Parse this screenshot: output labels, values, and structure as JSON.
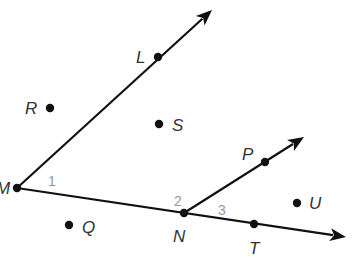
{
  "diagram": {
    "type": "geometry-rays-and-angles",
    "colors": {
      "stroke": "#111111",
      "point_label": "#333333",
      "angle_label": "#999999"
    },
    "points": [
      {
        "name": "M",
        "label": "M",
        "x": 17,
        "y": 188,
        "lx": -4,
        "ly": 194
      },
      {
        "name": "L",
        "label": "L",
        "x": 158,
        "y": 57,
        "lx": 136,
        "ly": 63
      },
      {
        "name": "R",
        "label": "R",
        "x": 50,
        "y": 108,
        "lx": 25,
        "ly": 114
      },
      {
        "name": "S",
        "label": "S",
        "x": 159,
        "y": 124,
        "lx": 172,
        "ly": 131
      },
      {
        "name": "N",
        "label": "N",
        "x": 184,
        "y": 213,
        "lx": 173,
        "ly": 242
      },
      {
        "name": "P",
        "label": "P",
        "x": 265,
        "y": 162,
        "lx": 242,
        "ly": 160
      },
      {
        "name": "T",
        "label": "T",
        "x": 254,
        "y": 224,
        "lx": 249,
        "ly": 254
      },
      {
        "name": "Q",
        "label": "Q",
        "x": 69,
        "y": 225,
        "lx": 82,
        "ly": 233
      },
      {
        "name": "U",
        "label": "U",
        "x": 297,
        "y": 203,
        "lx": 309,
        "ly": 209
      }
    ],
    "rays": [
      {
        "name": "ray-ML",
        "from": "M",
        "through": "L",
        "x1": 17,
        "y1": 188,
        "x2": 212,
        "y2": 10
      },
      {
        "name": "ray-MN",
        "from": "M",
        "through": "N,T",
        "x1": 17,
        "y1": 188,
        "x2": 346,
        "y2": 237
      },
      {
        "name": "ray-NP",
        "from": "N",
        "through": "P",
        "x1": 184,
        "y1": 213,
        "x2": 304,
        "y2": 137
      }
    ],
    "angles": [
      {
        "label": "1",
        "x": 48,
        "y": 186
      },
      {
        "label": "2",
        "x": 174,
        "y": 206
      },
      {
        "label": "3",
        "x": 218,
        "y": 215
      }
    ]
  }
}
